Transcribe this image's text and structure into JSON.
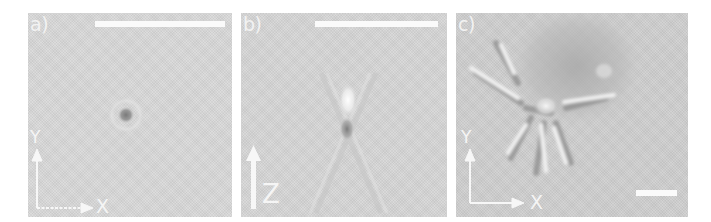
{
  "figure": {
    "panels": [
      {
        "id": "a",
        "label": "a)",
        "axes": {
          "vertical": "Y",
          "horizontal": "X"
        },
        "scalebar": true,
        "background": "#d9d9d9",
        "content": "single dark point spot at center"
      },
      {
        "id": "b",
        "label": "b)",
        "axes": {
          "vertical": "Z"
        },
        "scalebar": true,
        "background": "#d6d6d6",
        "content": "bright spot above dark spot with X-shaped fringes"
      },
      {
        "id": "c",
        "label": "c)",
        "axes": {
          "vertical": "Y",
          "horizontal": "X"
        },
        "scalebar": true,
        "background": "#cfcfcf",
        "content": "cell with radiating filament-like structures"
      }
    ]
  }
}
